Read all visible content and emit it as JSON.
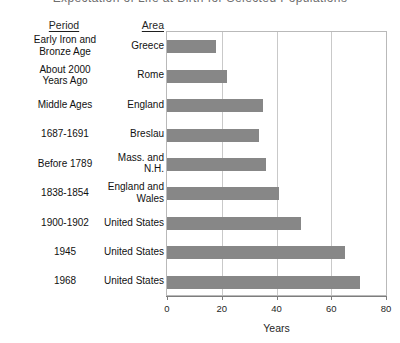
{
  "caption_sliver": "Expectation of Life at Birth for Selected Populations",
  "columns": {
    "period_header": "Period",
    "area_header": "Area"
  },
  "axis": {
    "xlabel": "Years",
    "ticks": [
      "0",
      "20",
      "40",
      "60",
      "80"
    ]
  },
  "colors": {
    "bar": "#878787",
    "grid": "#c9c9c9",
    "axis": "#7d7d7d",
    "text": "#1f1f1f",
    "background": "#ffffff"
  },
  "rows": [
    {
      "period": "Early Iron and Bronze Age",
      "period_l1": "Early Iron and",
      "period_l2": "Bronze Age",
      "area": "Greece",
      "area_l1": "Greece",
      "area_l2": "",
      "value": 18
    },
    {
      "period": "About 2000 Years Ago",
      "period_l1": "About 2000",
      "period_l2": "Years Ago",
      "area": "Rome",
      "area_l1": "Rome",
      "area_l2": "",
      "value": 22
    },
    {
      "period": "Middle Ages",
      "period_l1": "Middle Ages",
      "period_l2": "",
      "area": "England",
      "area_l1": "England",
      "area_l2": "",
      "value": 35
    },
    {
      "period": "1687-1691",
      "period_l1": "1687-1691",
      "period_l2": "",
      "area": "Breslau",
      "area_l1": "Breslau",
      "area_l2": "",
      "value": 33.5
    },
    {
      "period": "Before 1789",
      "period_l1": "Before 1789",
      "period_l2": "",
      "area": "Mass. and N.H.",
      "area_l1": "Mass. and N.H.",
      "area_l2": "",
      "value": 36
    },
    {
      "period": "1838-1854",
      "period_l1": "1838-1854",
      "period_l2": "",
      "area": "England and Wales",
      "area_l1": "England and",
      "area_l2": "Wales",
      "value": 41
    },
    {
      "period": "1900-1902",
      "period_l1": "1900-1902",
      "period_l2": "",
      "area": "United States",
      "area_l1": "United States",
      "area_l2": "",
      "value": 49
    },
    {
      "period": "1945",
      "period_l1": "1945",
      "period_l2": "",
      "area": "United States",
      "area_l1": "United States",
      "area_l2": "",
      "value": 65
    },
    {
      "period": "1968",
      "period_l1": "1968",
      "period_l2": "",
      "area": "United States",
      "area_l1": "United States",
      "area_l2": "",
      "value": 70.5
    }
  ],
  "chart_data": {
    "type": "bar",
    "orientation": "horizontal",
    "title": "",
    "xlabel": "Years",
    "ylabel": "",
    "xlim": [
      0,
      80
    ],
    "xticks": [
      0,
      20,
      40,
      60,
      80
    ],
    "grid": "vertical",
    "legend": "none",
    "categories": [
      "Greece (Early Iron and Bronze Age)",
      "Rome (About 2000 Years Ago)",
      "England (Middle Ages)",
      "Breslau (1687-1691)",
      "Mass. and N.H. (Before 1789)",
      "England and Wales (1838-1854)",
      "United States (1900-1902)",
      "United States (1945)",
      "United States (1968)"
    ],
    "values": [
      18,
      22,
      35,
      33.5,
      36,
      41,
      49,
      65,
      70.5
    ],
    "series": [
      {
        "name": "Expectation of life at birth (years)",
        "values": [
          18,
          22,
          35,
          33.5,
          36,
          41,
          49,
          65,
          70.5
        ]
      }
    ]
  }
}
